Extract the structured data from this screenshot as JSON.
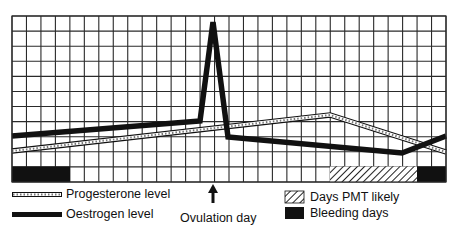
{
  "chart_data": {
    "type": "line",
    "title": "",
    "xlabel": "",
    "ylabel": "",
    "grid": true,
    "grid_columns": 30,
    "grid_rows": 11,
    "x_unit": "day of cycle (grid column)",
    "series": [
      {
        "name": "Oestrogen level",
        "style": "thick-black",
        "points": [
          [
            0,
            3.0
          ],
          [
            13,
            4.0
          ],
          [
            13.9,
            10.6
          ],
          [
            14.9,
            3.0
          ],
          [
            26.8,
            1.9
          ],
          [
            30,
            3.0
          ]
        ]
      },
      {
        "name": "Progesterone level",
        "style": "striped-white",
        "points": [
          [
            0,
            2.0
          ],
          [
            22,
            4.4
          ],
          [
            30,
            2.0
          ]
        ]
      }
    ],
    "bands": [
      {
        "name": "Bleeding days",
        "fill": "solid-black",
        "from_col": 0,
        "to_col": 4,
        "row": 0
      },
      {
        "name": "Days PMT likely",
        "fill": "hatched",
        "from_col": 22,
        "to_col": 28,
        "row": 0
      },
      {
        "name": "Bleeding days",
        "fill": "solid-black",
        "from_col": 28,
        "to_col": 30,
        "row": 0
      }
    ],
    "annotations": [
      {
        "text": "Ovulation day",
        "type": "arrow-up",
        "at_col": 13.9
      }
    ],
    "legend": [
      {
        "label": "Progesterone level",
        "swatch": "striped-line"
      },
      {
        "label": "Oestrogen level",
        "swatch": "thick-black-line"
      },
      {
        "label": "Days PMT likely",
        "swatch": "hatched-box"
      },
      {
        "label": "Bleeding days",
        "swatch": "black-box"
      }
    ]
  },
  "legend": {
    "progesterone": "Progesterone level",
    "oestrogen": "Oestrogen level",
    "pmt": "Days PMT likely",
    "bleeding": "Bleeding days"
  },
  "annotation": {
    "ovulation": "Ovulation day"
  },
  "colors": {
    "ink": "#111111",
    "grid": "#2a2a2a",
    "background": "#ffffff"
  }
}
